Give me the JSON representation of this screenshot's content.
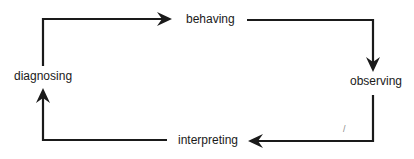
{
  "diagram": {
    "type": "cycle",
    "nodes": [
      {
        "id": "behaving",
        "label": "behaving"
      },
      {
        "id": "observing",
        "label": "observing"
      },
      {
        "id": "interpreting",
        "label": "interpreting"
      },
      {
        "id": "diagnosing",
        "label": "diagnosing"
      }
    ],
    "edges": [
      {
        "from": "diagnosing",
        "to": "behaving"
      },
      {
        "from": "behaving",
        "to": "observing"
      },
      {
        "from": "observing",
        "to": "interpreting"
      },
      {
        "from": "interpreting",
        "to": "diagnosing"
      }
    ],
    "colors": {
      "stroke": "#1a1a1a",
      "text": "#1a1a1a",
      "background": "#ffffff"
    },
    "stray_mark": "/"
  }
}
